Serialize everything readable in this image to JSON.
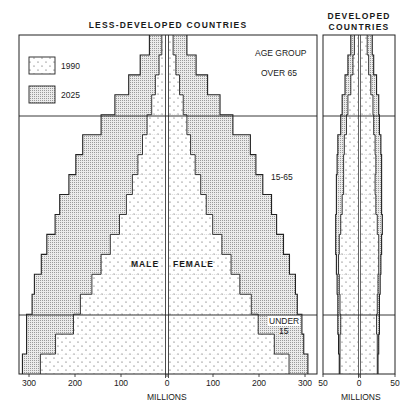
{
  "chart_data": [
    {
      "type": "bar",
      "subtype": "population-pyramid",
      "title": "LESS-DEVELOPED COUNTRIES",
      "xlabel": "MILLIONS",
      "x_ticks_left": [
        "300",
        "200",
        "100",
        "0"
      ],
      "x_ticks_right": [
        "100",
        "200",
        "300"
      ],
      "xlim": [
        -320,
        320
      ],
      "legend": [
        {
          "label": "1990",
          "pattern": "sparse-dots"
        },
        {
          "label": "2025",
          "pattern": "fine-stipple"
        }
      ],
      "side_labels": {
        "male": "MALE",
        "female": "FEMALE"
      },
      "age_group_heading": "AGE GROUP",
      "age_groups": [
        {
          "label": "OVER 65",
          "bands": 4
        },
        {
          "label": "15-65",
          "bands": 10
        },
        {
          "label": "UNDER 15",
          "bands": 3
        }
      ],
      "bands_bottom_to_top": [
        "0-4",
        "5-9",
        "10-14",
        "15-19",
        "20-24",
        "25-29",
        "30-34",
        "35-39",
        "40-44",
        "45-49",
        "50-54",
        "55-59",
        "60-64",
        "65-69",
        "70-74",
        "75-79",
        "80+"
      ],
      "series": [
        {
          "name": "1990 male",
          "values": [
            272,
            239,
            200,
            185,
            160,
            140,
            120,
            100,
            85,
            72,
            60,
            50,
            40,
            30,
            22,
            14,
            8
          ]
        },
        {
          "name": "1990 female",
          "values": [
            262,
            230,
            195,
            180,
            155,
            136,
            116,
            96,
            82,
            70,
            58,
            48,
            40,
            32,
            24,
            16,
            10
          ]
        },
        {
          "name": "2025 male",
          "values": [
            311,
            302,
            302,
            290,
            285,
            270,
            258,
            240,
            230,
            210,
            195,
            180,
            140,
            110,
            80,
            55,
            35
          ]
        },
        {
          "name": "2025 female",
          "values": [
            303,
            294,
            290,
            280,
            276,
            263,
            250,
            235,
            224,
            205,
            190,
            178,
            140,
            112,
            85,
            60,
            40
          ]
        }
      ]
    },
    {
      "type": "bar",
      "subtype": "population-pyramid",
      "title": "DEVELOPED COUNTRIES",
      "xlabel": "MILLIONS",
      "x_ticks_left": [
        "50",
        "0"
      ],
      "x_ticks_right": [
        "50"
      ],
      "xlim": [
        -50,
        50
      ],
      "bands_bottom_to_top": [
        "0-4",
        "5-9",
        "10-14",
        "15-19",
        "20-24",
        "25-29",
        "30-34",
        "35-39",
        "40-44",
        "45-49",
        "50-54",
        "55-59",
        "60-64",
        "65-69",
        "70-74",
        "75-79",
        "80+"
      ],
      "series": [
        {
          "name": "1990 male",
          "values": [
            25,
            25,
            24,
            25,
            26,
            27,
            26,
            24,
            22,
            20,
            20,
            19,
            16,
            14,
            10,
            7,
            5
          ]
        },
        {
          "name": "1990 female",
          "values": [
            24,
            24,
            23,
            24,
            25,
            26,
            26,
            24,
            22,
            21,
            22,
            21,
            19,
            18,
            15,
            12,
            10
          ]
        },
        {
          "name": "2025 male",
          "values": [
            26,
            27,
            28,
            28,
            29,
            30,
            31,
            31,
            30,
            30,
            29,
            28,
            24,
            22,
            18,
            14,
            10
          ]
        },
        {
          "name": "2025 female",
          "values": [
            25,
            26,
            27,
            27,
            28,
            29,
            30,
            31,
            30,
            30,
            30,
            29,
            27,
            26,
            23,
            19,
            17
          ]
        }
      ]
    }
  ],
  "labels": {
    "main_title": "LESS-DEVELOPED COUNTRIES",
    "dev_title_line1": "DEVELOPED",
    "dev_title_line2": "COUNTRIES",
    "legend_1990": "1990",
    "legend_2025": "2025",
    "age_group": "AGE GROUP",
    "over65": "OVER 65",
    "mid": "15-65",
    "under15_line1": "UNDER",
    "under15_line2": "15",
    "male": "MALE",
    "female": "FEMALE",
    "millions": "MILLIONS",
    "dev_millions": "MILLIONS"
  }
}
